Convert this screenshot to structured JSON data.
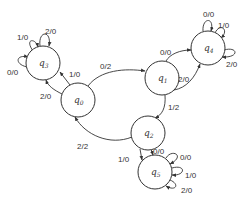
{
  "diagram": {
    "type": "finite-state-transducer",
    "nodes": [
      {
        "id": "q0",
        "label": "q",
        "sub": "0",
        "x": 78,
        "y": 100
      },
      {
        "id": "q1",
        "label": "q",
        "sub": "1",
        "x": 162,
        "y": 78
      },
      {
        "id": "q2",
        "label": "q",
        "sub": "2",
        "x": 148,
        "y": 133
      },
      {
        "id": "q3",
        "label": "q",
        "sub": "3",
        "x": 43,
        "y": 63
      },
      {
        "id": "q4",
        "label": "q",
        "sub": "4",
        "x": 208,
        "y": 48
      },
      {
        "id": "q5",
        "label": "q",
        "sub": "5",
        "x": 155,
        "y": 172
      }
    ],
    "edges": [
      {
        "from": "q3",
        "to": "q3",
        "label": "1/0"
      },
      {
        "from": "q3",
        "to": "q3",
        "label": "2/0"
      },
      {
        "from": "q3",
        "to": "q3",
        "label": "0/0"
      },
      {
        "from": "q0",
        "to": "q3",
        "label": "1/0"
      },
      {
        "from": "q0",
        "to": "q3",
        "label": "2/0"
      },
      {
        "from": "q0",
        "to": "q1",
        "label": "0/2"
      },
      {
        "from": "q1",
        "to": "q4",
        "label": "0/0"
      },
      {
        "from": "q1",
        "to": "q4",
        "label": "2/0"
      },
      {
        "from": "q4",
        "to": "q4",
        "label": "0/0"
      },
      {
        "from": "q4",
        "to": "q4",
        "label": "1/0"
      },
      {
        "from": "q4",
        "to": "q4",
        "label": "2/0"
      },
      {
        "from": "q1",
        "to": "q2",
        "label": "1/2"
      },
      {
        "from": "q2",
        "to": "q0",
        "label": "2/2"
      },
      {
        "from": "q2",
        "to": "q5",
        "label": "1/0"
      },
      {
        "from": "q2",
        "to": "q5",
        "label": "0/0"
      },
      {
        "from": "q5",
        "to": "q5",
        "label": "0/0"
      },
      {
        "from": "q5",
        "to": "q5",
        "label": "1/0"
      },
      {
        "from": "q5",
        "to": "q5",
        "label": "2/0"
      }
    ]
  },
  "labels": {
    "q0": {
      "main": "q",
      "sub": "0"
    },
    "q1": {
      "main": "q",
      "sub": "1"
    },
    "q2": {
      "main": "q",
      "sub": "2"
    },
    "q3": {
      "main": "q",
      "sub": "3"
    },
    "q4": {
      "main": "q",
      "sub": "4"
    },
    "q5": {
      "main": "q",
      "sub": "5"
    },
    "q3_loop_1": "1/0",
    "q3_loop_2": "2/0",
    "q3_loop_0": "0/0",
    "q0_q3_a": "1/0",
    "q0_q3_b": "2/0",
    "q0_q1": "0/2",
    "q1_q4_a": "0/0",
    "q1_q4_b": "2/0",
    "q4_loop_0": "0/0",
    "q4_loop_1": "1/0",
    "q4_loop_2": "2/0",
    "q1_q2": "1/2",
    "q2_q0": "2/2",
    "q2_q5_a": "1/0",
    "q2_q5_b": "0/0",
    "q5_loop_0": "0/0",
    "q5_loop_1": "1/0",
    "q5_loop_2": "2/0"
  }
}
